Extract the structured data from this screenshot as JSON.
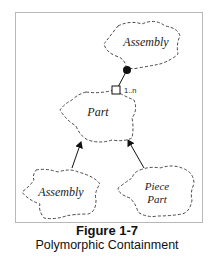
{
  "diagram": {
    "nodes": [
      {
        "id": "assembly-top",
        "label": "Assembly",
        "shape": "cloud"
      },
      {
        "id": "part",
        "label": "Part",
        "shape": "cloud"
      },
      {
        "id": "assembly-bottom",
        "label": "Assembly",
        "shape": "cloud"
      },
      {
        "id": "piece-part",
        "label_line1": "Piece",
        "label_line2": "Part",
        "shape": "cloud"
      }
    ],
    "edges": [
      {
        "from": "assembly-top",
        "to": "part",
        "type": "has-by-value",
        "multiplicity": "1..n"
      },
      {
        "from": "assembly-bottom",
        "to": "part",
        "type": "inheritance"
      },
      {
        "from": "piece-part",
        "to": "part",
        "type": "inheritance"
      }
    ]
  },
  "caption": {
    "title": "Figure 1-7",
    "subtitle": "Polymorphic Containment"
  }
}
